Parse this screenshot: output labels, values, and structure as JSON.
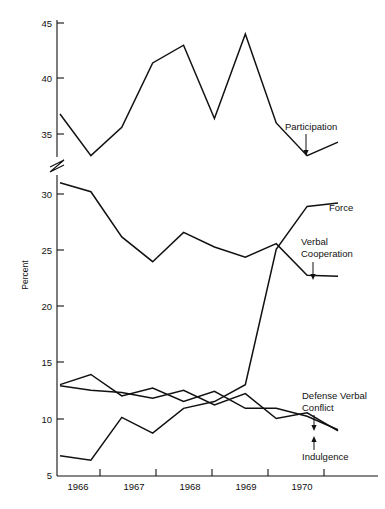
{
  "chart_data": {
    "type": "line",
    "title": "",
    "subtitle": "",
    "xlabel": "",
    "ylabel": "Percent",
    "x": [
      1966.0,
      1966.5,
      1967.0,
      1967.5,
      1968.0,
      1968.5,
      1969.0,
      1969.5,
      1970.0,
      1970.5
    ],
    "xtick_labels": [
      "1966",
      "1967",
      "1968",
      "1969",
      "1970"
    ],
    "ytick_labels": [
      "5",
      "10",
      "15",
      "20",
      "25",
      "30",
      "35",
      "40",
      "45"
    ],
    "ylim": [
      5,
      45
    ],
    "axis_break": {
      "present": true,
      "between": [
        30,
        35
      ]
    },
    "grid": false,
    "legend_position": "inline-annotations",
    "series": [
      {
        "name": "Participation",
        "values": [
          36.8,
          33.4,
          35.6,
          41.4,
          43.0,
          36.4,
          44.0,
          36.0,
          33.4,
          34.6
        ]
      },
      {
        "name": "Force",
        "values": [
          6.8,
          6.4,
          10.2,
          8.8,
          11.0,
          11.6,
          13.1,
          25.1,
          28.9,
          29.2
        ]
      },
      {
        "name": "Verbal Cooperation",
        "values": [
          31.0,
          30.2,
          26.2,
          24.0,
          26.6,
          25.3,
          24.4,
          25.6,
          22.8,
          22.7
        ]
      },
      {
        "name": "Defense Verbal Conflict",
        "values": [
          13.1,
          14.0,
          12.1,
          12.8,
          11.6,
          12.5,
          11.0,
          11.0,
          10.3,
          9.1
        ]
      },
      {
        "name": "Indulgence",
        "values": [
          13.0,
          12.6,
          12.4,
          11.9,
          12.6,
          11.3,
          12.3,
          10.1,
          10.6,
          9.0
        ]
      }
    ],
    "annotations": [
      {
        "text": "Participation",
        "series": "Participation"
      },
      {
        "text": "Force",
        "series": "Force"
      },
      {
        "text": "Verbal Cooperation",
        "series": "Verbal Cooperation"
      },
      {
        "text": "Defense Verbal Conflict",
        "series": "Defense Verbal Conflict"
      },
      {
        "text": "Indulgence",
        "series": "Indulgence"
      }
    ]
  },
  "axis": {
    "y_title": "Percent",
    "y_ticks": [
      "45",
      "40",
      "35",
      "30",
      "25",
      "20",
      "15",
      "10",
      "5"
    ],
    "x_ticks": [
      "1966",
      "1967",
      "1968",
      "1969",
      "1970"
    ]
  },
  "labels": {
    "participation": "Participation",
    "force": "Force",
    "verbal_cooperation_line1": "Verbal",
    "verbal_cooperation_line2": "Cooperation",
    "defense_verbal_line1": "Defense Verbal",
    "defense_verbal_line2": "Conflict",
    "indulgence": "Indulgence"
  }
}
